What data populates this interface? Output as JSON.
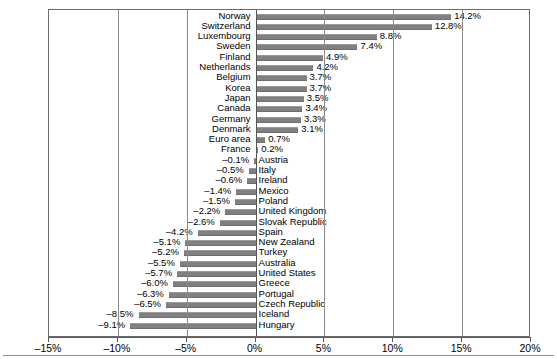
{
  "chart_data": {
    "type": "bar",
    "orientation": "horizontal",
    "title": "",
    "subtitle": "",
    "xlabel": "",
    "ylabel": "",
    "xlim": [
      -15,
      20
    ],
    "xticks": [
      -15,
      -10,
      -5,
      0,
      5,
      10,
      15,
      20
    ],
    "xtick_labels": [
      "–15%",
      "–10%",
      "–5%",
      "0%",
      "5%",
      "10%",
      "15%",
      "20%"
    ],
    "grid": true,
    "grid_axis": "x",
    "legend": false,
    "bar_color": "#808080",
    "categories": [
      "Norway",
      "Switzerland",
      "Luxembourg",
      "Sweden",
      "Finland",
      "Netherlands",
      "Belgium",
      "Korea",
      "Japan",
      "Canada",
      "Germany",
      "Denmark",
      "Euro area",
      "France",
      "Austria",
      "Italy",
      "Ireland",
      "Mexico",
      "Poland",
      "United Kingdom",
      "Slovak Republic",
      "Spain",
      "New Zealand",
      "Turkey",
      "Australia",
      "United States",
      "Greece",
      "Portugal",
      "Czech Republic",
      "Iceland",
      "Hungary"
    ],
    "values": [
      14.2,
      12.8,
      8.8,
      7.4,
      4.9,
      4.2,
      3.7,
      3.7,
      3.5,
      3.4,
      3.3,
      3.1,
      0.7,
      0.2,
      -0.1,
      -0.5,
      -0.6,
      -1.4,
      -1.5,
      -2.2,
      -2.6,
      -4.2,
      -5.1,
      -5.2,
      -5.5,
      -5.7,
      -6.0,
      -6.3,
      -6.5,
      -8.5,
      -9.1
    ],
    "value_labels": [
      "14.2%",
      "12.8%",
      "8.8%",
      "7.4%",
      "4.9%",
      "4.2%",
      "3.7%",
      "3.7%",
      "3.5%",
      "3.4%",
      "3.3%",
      "3.1%",
      "0.7%",
      "0.2%",
      "–0.1%",
      "–0.5%",
      "–0.6%",
      "–1.4%",
      "–1.5%",
      "–2.2%",
      "–2.6%",
      "–4.2%",
      "–5.1%",
      "–5.2%",
      "–5.5%",
      "–5.7%",
      "–6.0%",
      "–6.3%",
      "–6.5%",
      "–8.5%",
      "–9.1%"
    ]
  }
}
